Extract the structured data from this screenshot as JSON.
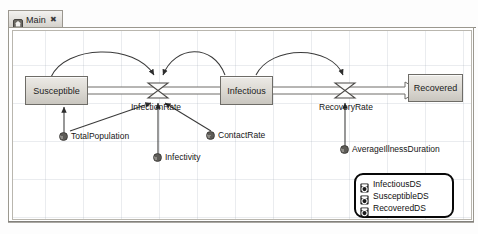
{
  "window": {
    "tab": {
      "label": "Main",
      "icon": "home-icon",
      "close": "✖"
    }
  },
  "diagram": {
    "stocks": [
      {
        "name": "Susceptible",
        "label": "Susceptible"
      },
      {
        "name": "Infectious",
        "label": "Infectious"
      },
      {
        "name": "Recovered",
        "label": "Recovered"
      }
    ],
    "flows": [
      {
        "name": "InfectionRate",
        "label": "InfectionRate"
      },
      {
        "name": "RecoveryRate",
        "label": "RecoveryRate"
      }
    ],
    "parameters": [
      {
        "name": "TotalPopulation",
        "label": "TotalPopulation"
      },
      {
        "name": "Infectivity",
        "label": "Infectivity"
      },
      {
        "name": "ContactRate",
        "label": "ContactRate"
      },
      {
        "name": "AverageIllnessDuration",
        "label": "AverageIllnessDuration"
      }
    ],
    "datasets": {
      "name": "dataset-group",
      "items": [
        {
          "label": "InfectiousDS"
        },
        {
          "label": "SusceptibleDS"
        },
        {
          "label": "RecoveredDS"
        }
      ]
    },
    "colors": {
      "stock_fill": "#dedbd5",
      "stock_border": "#6e6c67",
      "link": "#3a3a3a",
      "grid": "#96a0af",
      "dataset_border": "#080808"
    }
  }
}
